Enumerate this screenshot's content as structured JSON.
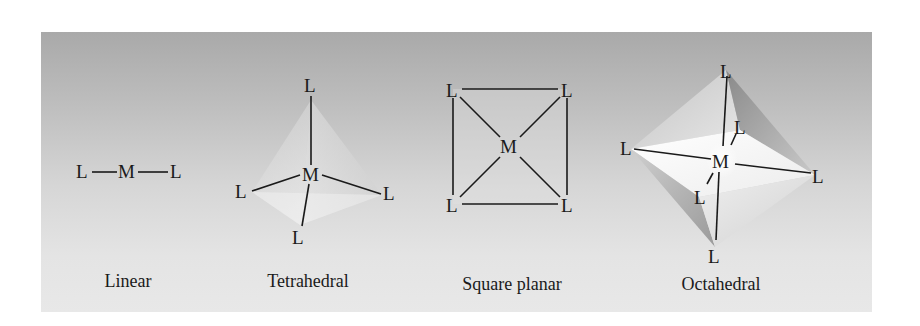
{
  "figure": {
    "atom_labels": {
      "metal": "M",
      "ligand": "L"
    },
    "geometries": [
      {
        "name": "Linear",
        "caption": "Linear",
        "coordination_number": 2,
        "metal": "M",
        "ligands": [
          "L",
          "L"
        ]
      },
      {
        "name": "Tetrahedral",
        "caption": "Tetrahedral",
        "coordination_number": 4,
        "metal": "M",
        "ligands": [
          "L",
          "L",
          "L",
          "L"
        ]
      },
      {
        "name": "Square planar",
        "caption": "Square planar",
        "coordination_number": 4,
        "metal": "M",
        "ligands": [
          "L",
          "L",
          "L",
          "L"
        ]
      },
      {
        "name": "Octahedral",
        "caption": "Octahedral",
        "coordination_number": 6,
        "metal": "M",
        "ligands": [
          "L",
          "L",
          "L",
          "L",
          "L",
          "L"
        ]
      }
    ],
    "colors": {
      "panel_top": "#a9a9a9",
      "panel_bottom": "#e8e8e8",
      "ink": "#1a1a1a"
    }
  }
}
